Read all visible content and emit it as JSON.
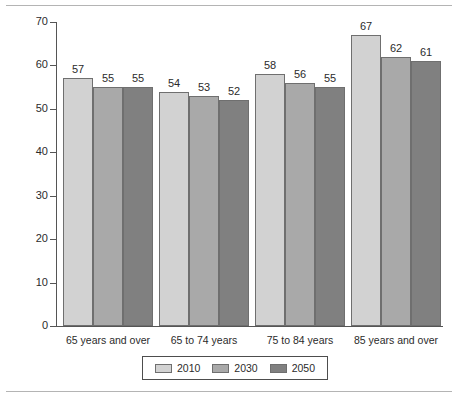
{
  "chart_data": {
    "type": "bar",
    "title": "",
    "subtitle": "",
    "xlabel": "",
    "ylabel": "",
    "categories": [
      "65 years and over",
      "65 to 74 years",
      "75 to 84 years",
      "85 years and over"
    ],
    "series": [
      {
        "name": "2010",
        "values": [
          57,
          54,
          58,
          67
        ],
        "color": "#d2d2d2"
      },
      {
        "name": "2030",
        "values": [
          55,
          53,
          56,
          62
        ],
        "color": "#a9a9a9"
      },
      {
        "name": "2050",
        "values": [
          55,
          52,
          55,
          61
        ],
        "color": "#808080"
      }
    ],
    "ylim": [
      0,
      70
    ],
    "ytick_values": [
      0,
      10,
      20,
      30,
      40,
      50,
      60,
      70
    ],
    "ytick_labels": [
      "0",
      "10",
      "20",
      "30",
      "40",
      "50",
      "60",
      "70"
    ],
    "grid": false,
    "legend_position": "bottom-center",
    "data_labels_shown": true,
    "axis_color": "#555555",
    "bar_border_color": "#6f6f6f",
    "frame_rule_color": "#b4b4b4",
    "background": "#ffffff"
  }
}
